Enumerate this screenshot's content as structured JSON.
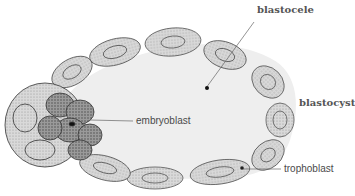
{
  "diagram": {
    "colors": {
      "cavity": "#eeeeee",
      "cell_fill": "#d6d6d6",
      "cell_stroke": "#555555",
      "inner_mass": "#8a8a8a",
      "leader_line": "#666666",
      "label_text": "#4a4a4a"
    },
    "labels": {
      "blastocele": "blastocele",
      "blastocyst": "blastocyst",
      "embryoblast": "embryoblast",
      "trophoblast": "trophoblast"
    }
  }
}
